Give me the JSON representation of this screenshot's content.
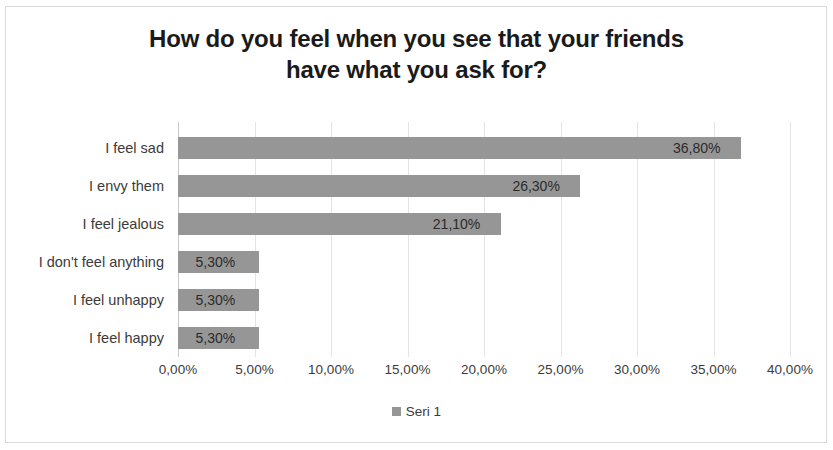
{
  "chart_data": {
    "type": "bar",
    "orientation": "horizontal",
    "title": "How do you feel when you see that your friends have what you ask for?",
    "title_lines": [
      "How do you feel when you see that your friends",
      "have what you ask for?"
    ],
    "categories": [
      "I feel sad",
      "I envy them",
      "I feel jealous",
      "I don't feel anything",
      "I feel unhappy",
      "I feel happy"
    ],
    "values": [
      36.8,
      26.3,
      21.1,
      5.3,
      5.3,
      5.3
    ],
    "value_labels": [
      "36,80%",
      "26,30%",
      "21,10%",
      "5,30%",
      "5,30%",
      "5,30%"
    ],
    "series": [
      {
        "name": "Seri 1",
        "values": [
          36.8,
          26.3,
          21.1,
          5.3,
          5.3,
          5.3
        ]
      }
    ],
    "xlabel": "",
    "ylabel": "",
    "xlim": [
      0,
      40
    ],
    "xticks": [
      0,
      5,
      10,
      15,
      20,
      25,
      30,
      35,
      40
    ],
    "xtick_labels": [
      "0,00%",
      "5,00%",
      "10,00%",
      "15,00%",
      "20,00%",
      "25,00%",
      "30,00%",
      "35,00%",
      "40,00%"
    ],
    "grid": true,
    "grid_axis": "x",
    "legend": {
      "position": "bottom",
      "entries": [
        {
          "label": "Seri 1",
          "marker": "legend-swatch-icon"
        }
      ]
    },
    "colors": {
      "bar": "#969696",
      "gridline": "#e4e4e4",
      "axis_line": "#c9c9c9",
      "title_text": "#1a1a1a",
      "label_text": "#3b3b3b",
      "background": "#ffffff",
      "border": "#d9d9d9"
    }
  }
}
